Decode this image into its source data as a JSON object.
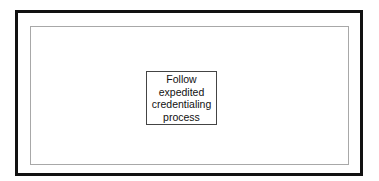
{
  "diagram": {
    "nodes": [
      {
        "id": "node-1",
        "lines": [
          "Follow",
          "expedited",
          "credentialing",
          "process"
        ]
      }
    ]
  }
}
